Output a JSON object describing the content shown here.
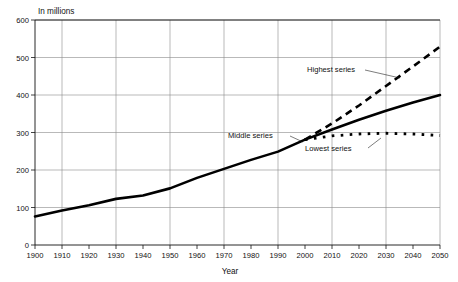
{
  "chart_data": {
    "type": "line",
    "title": "",
    "unit_label": "In millions",
    "xlabel": "Year",
    "ylabel": "",
    "xlim": [
      1900,
      2050
    ],
    "ylim": [
      0,
      600
    ],
    "ytick_labels": [
      "0",
      "100",
      "200",
      "300",
      "400",
      "500",
      "600"
    ],
    "yticks": [
      0,
      100,
      200,
      300,
      400,
      500,
      600
    ],
    "xtick_labels": [
      "1900",
      "1910",
      "1920",
      "1930",
      "1940",
      "1950",
      "1960",
      "1970",
      "1980",
      "1990",
      "2000",
      "2010",
      "2020",
      "2030",
      "2040",
      "2050"
    ],
    "xticks": [
      1900,
      1910,
      1920,
      1930,
      1940,
      1950,
      1960,
      1970,
      1980,
      1990,
      2000,
      2010,
      2020,
      2030,
      2040,
      2050
    ],
    "grid": "both-axes-light-gray",
    "vertical_gridlines_at": [
      1910,
      1930,
      1950,
      1970,
      1990,
      2010,
      2030,
      2050
    ],
    "horizontal_gridlines_at": [
      100,
      200,
      300,
      400,
      500,
      600
    ],
    "legend": "inline-annotations",
    "series": [
      {
        "name": "Historical",
        "style": "solid",
        "x": [
          1900,
          1910,
          1920,
          1930,
          1940,
          1950,
          1960,
          1970,
          1980,
          1990,
          2000
        ],
        "values": [
          76,
          92,
          106,
          123,
          132,
          151,
          179,
          203,
          227,
          249,
          281
        ]
      },
      {
        "name": "Highest series",
        "style": "dashed",
        "x": [
          2000,
          2010,
          2020,
          2030,
          2040,
          2050
        ],
        "values": [
          281,
          324,
          372,
          424,
          476,
          529
        ]
      },
      {
        "name": "Middle series",
        "style": "solid",
        "x": [
          2000,
          2010,
          2020,
          2030,
          2040,
          2050
        ],
        "values": [
          281,
          308,
          334,
          358,
          380,
          400
        ]
      },
      {
        "name": "Lowest series",
        "style": "dotted",
        "x": [
          2000,
          2010,
          2020,
          2030,
          2040,
          2050
        ],
        "values": [
          281,
          291,
          296,
          298,
          296,
          292
        ]
      }
    ],
    "annotations": [
      {
        "key": "highest",
        "text": "Highest series"
      },
      {
        "key": "middle",
        "text": "Middle series"
      },
      {
        "key": "lowest",
        "text": "Lowest series"
      }
    ]
  }
}
